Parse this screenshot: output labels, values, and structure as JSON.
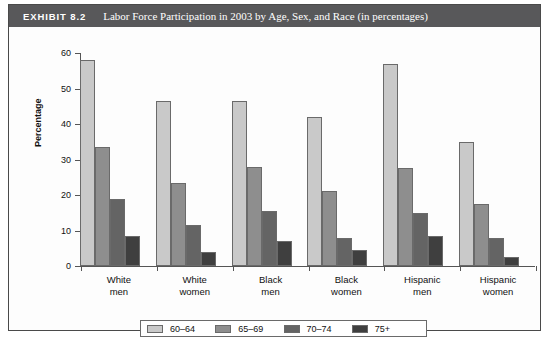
{
  "exhibit": {
    "label": "EXHIBIT 8.2",
    "title": "Labor Force Participation in 2003 by Age, Sex, and Race (in percentages)"
  },
  "colors": {
    "title_bar": "#58585a",
    "series_60_64": "#c9c9c9",
    "series_65_69": "#8e8e8e",
    "series_70_74": "#646464",
    "series_75_plus": "#3f3f3f",
    "frame": "#4a4a4a"
  },
  "chart_data": {
    "type": "bar",
    "title": "Labor Force Participation in 2003 by Age, Sex, and Race (in percentages)",
    "xlabel": "",
    "ylabel": "Percentage",
    "ylim": [
      0,
      60
    ],
    "yticks": [
      0,
      10,
      20,
      30,
      40,
      50,
      60
    ],
    "grid": false,
    "legend_position": "bottom",
    "categories": [
      "White men",
      "White women",
      "Black men",
      "Black women",
      "Hispanic men",
      "Hispanic women"
    ],
    "category_lines": [
      [
        "White",
        "men"
      ],
      [
        "White",
        "women"
      ],
      [
        "Black",
        "men"
      ],
      [
        "Black",
        "women"
      ],
      [
        "Hispanic",
        "men"
      ],
      [
        "Hispanic",
        "women"
      ]
    ],
    "series": [
      {
        "name": "60–64",
        "color": "#c9c9c9",
        "values": [
          58,
          46.5,
          46.5,
          42,
          57,
          35
        ]
      },
      {
        "name": "65–69",
        "color": "#8e8e8e",
        "values": [
          33.5,
          23.5,
          28,
          21,
          27.5,
          17.5
        ]
      },
      {
        "name": "70–74",
        "color": "#646464",
        "values": [
          19,
          11.5,
          15.5,
          8,
          15,
          8
        ]
      },
      {
        "name": "75+",
        "color": "#3f3f3f",
        "values": [
          8.5,
          4,
          7,
          4.5,
          8.5,
          2.5
        ]
      }
    ]
  }
}
